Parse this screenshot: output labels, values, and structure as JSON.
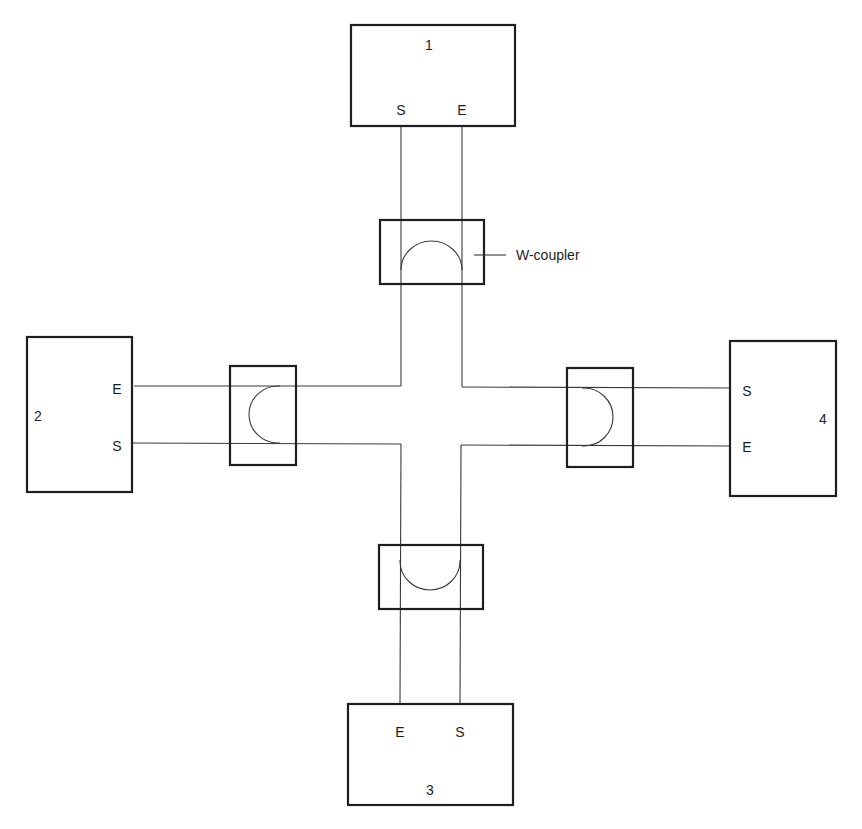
{
  "diagram": {
    "type": "network-topology",
    "callout": {
      "label": "W-coupler"
    },
    "nodes": [
      {
        "id": "1",
        "label": "1",
        "ports": [
          {
            "label": "S"
          },
          {
            "label": "E"
          }
        ],
        "position": "top"
      },
      {
        "id": "2",
        "label": "2",
        "ports": [
          {
            "label": "E"
          },
          {
            "label": "S"
          }
        ],
        "position": "left"
      },
      {
        "id": "3",
        "label": "3",
        "ports": [
          {
            "label": "E"
          },
          {
            "label": "S"
          }
        ],
        "position": "bottom"
      },
      {
        "id": "4",
        "label": "4",
        "ports": [
          {
            "label": "S"
          },
          {
            "label": "E"
          }
        ],
        "position": "right"
      }
    ],
    "couplers": [
      {
        "id": "top",
        "type": "W-coupler",
        "attached_to": "1"
      },
      {
        "id": "left",
        "type": "W-coupler",
        "attached_to": "2"
      },
      {
        "id": "bottom",
        "type": "W-coupler",
        "attached_to": "3"
      },
      {
        "id": "right",
        "type": "W-coupler",
        "attached_to": "4"
      }
    ],
    "colors": {
      "stroke": "#1e1e1e",
      "wire": "#3a3a3a",
      "background": "#ffffff"
    }
  }
}
